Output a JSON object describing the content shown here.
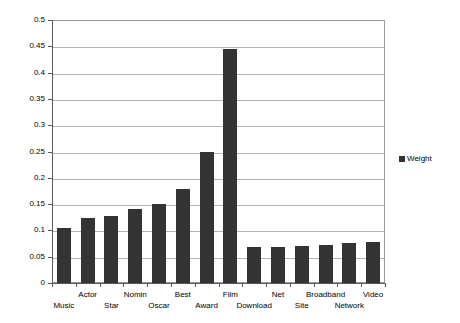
{
  "chart_data": {
    "type": "bar",
    "title": "",
    "subtitle": "",
    "xlabel": "",
    "ylabel": "",
    "ylim": [
      0,
      0.5
    ],
    "ytick_labels": [
      "0.5",
      "0.45",
      "0.4",
      "0.35",
      "0.3",
      "0.25",
      "0.2",
      "0.15",
      "0.1",
      "0.05",
      "0"
    ],
    "ytick_values": [
      0.5,
      0.45,
      0.4,
      0.35,
      0.3,
      0.25,
      0.2,
      0.15,
      0.1,
      0.05,
      0
    ],
    "grid": true,
    "legend_position": "right",
    "categories": [
      "Music",
      "Actor",
      "Star",
      "Nomin",
      "Oscar",
      "Best",
      "Award",
      "Film",
      "Download",
      "Net",
      "Site",
      "Broadband",
      "Network",
      "Video"
    ],
    "category_label_rows": [
      "lower",
      "upper",
      "lower",
      "upper",
      "lower",
      "upper",
      "lower",
      "upper",
      "lower",
      "upper",
      "lower",
      "upper",
      "lower",
      "upper"
    ],
    "series": [
      {
        "name": "Weight",
        "color": "#333333",
        "values": [
          0.105,
          0.124,
          0.127,
          0.14,
          0.15,
          0.178,
          0.249,
          0.445,
          0.068,
          0.068,
          0.071,
          0.073,
          0.076,
          0.078
        ]
      }
    ]
  },
  "legend": {
    "entries": [
      {
        "label": "Weight",
        "color": "#333333"
      }
    ]
  },
  "axis": {
    "y_max_label": "0.5",
    "y_min_label": "0"
  }
}
